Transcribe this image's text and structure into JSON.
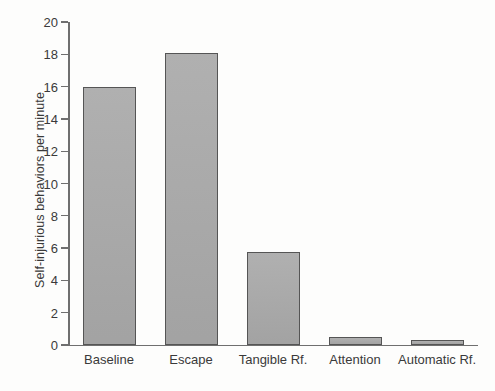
{
  "chart_data": {
    "type": "bar",
    "title": "",
    "xlabel": "",
    "ylabel": "Self-injurious behaviors per minute",
    "categories": [
      "Baseline",
      "Escape",
      "Tangible Rf.",
      "Attention",
      "Automatic Rf."
    ],
    "values": [
      16.0,
      18.05,
      5.75,
      0.5,
      0.3
    ],
    "ylim": [
      0,
      20
    ],
    "yticks": [
      0,
      2,
      4,
      6,
      8,
      10,
      12,
      14,
      16,
      18,
      20
    ],
    "ytick_labels": [
      "0",
      "2",
      "4",
      "6",
      "8",
      "10",
      "12",
      "14",
      "16",
      "18",
      "20"
    ],
    "grid": false,
    "legend": "none",
    "bar_color": "#aaaaaa",
    "bar_edge_color": "#555555",
    "axis_color": "#6f6f6f",
    "background_color": "#ffffff"
  }
}
